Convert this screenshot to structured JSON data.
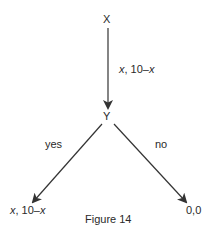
{
  "diagram": {
    "type": "game-tree",
    "nodes": {
      "root": {
        "label": "X"
      },
      "mid": {
        "label": "Y"
      },
      "leaf_yes": {
        "payoff_prefix": "x",
        "payoff_sep": ", 10–",
        "payoff_suffix": "x"
      },
      "leaf_no": {
        "label": "0,0"
      }
    },
    "edges": {
      "root_to_mid": {
        "label_prefix": "x",
        "label_sep": ", 10–",
        "label_suffix": "x"
      },
      "mid_to_yes": {
        "label": "yes"
      },
      "mid_to_no": {
        "label": "no"
      }
    },
    "caption": "Figure 14",
    "colors": {
      "line": "#333333",
      "text": "#2a2a2a",
      "background": "#ffffff"
    }
  }
}
